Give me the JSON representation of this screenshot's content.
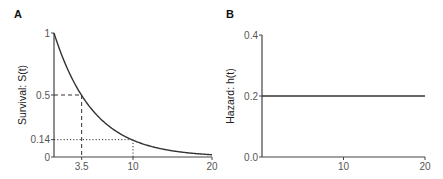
{
  "chart_data": [
    {
      "panel": "A",
      "type": "line",
      "title": "",
      "xlabel": "",
      "ylabel": "Survival: S(t)",
      "xlim": [
        0,
        20
      ],
      "ylim": [
        0,
        1
      ],
      "x_ticks": [
        3.5,
        10,
        20
      ],
      "x_tick_labels": [
        "3.5",
        "10",
        "20"
      ],
      "y_ticks": [
        0,
        0.14,
        0.5,
        1
      ],
      "y_tick_labels": [
        "0",
        "0.14",
        "0.5",
        "1"
      ],
      "grid": false,
      "series": [
        {
          "name": "S(t) = exp(-0.2 t)",
          "function": "exp",
          "rate": 0.2,
          "x_range": [
            0,
            20
          ]
        }
      ],
      "annotations": [
        {
          "type": "dashed-guide",
          "x": 3.5,
          "y": 0.5
        },
        {
          "type": "dotted-guide",
          "x": 10,
          "y": 0.14
        }
      ]
    },
    {
      "panel": "B",
      "type": "line",
      "title": "",
      "xlabel": "",
      "ylabel": "Hazard: h(t)",
      "xlim": [
        0,
        20
      ],
      "ylim": [
        0,
        0.4
      ],
      "x_ticks": [
        10,
        20
      ],
      "x_tick_labels": [
        "10",
        "20"
      ],
      "y_ticks": [
        0.0,
        0.2,
        0.4
      ],
      "y_tick_labels": [
        "0.0",
        "0.2",
        "0.4"
      ],
      "grid": false,
      "series": [
        {
          "name": "h(t) = 0.2",
          "x": [
            0,
            20
          ],
          "y": [
            0.2,
            0.2
          ]
        }
      ]
    }
  ]
}
